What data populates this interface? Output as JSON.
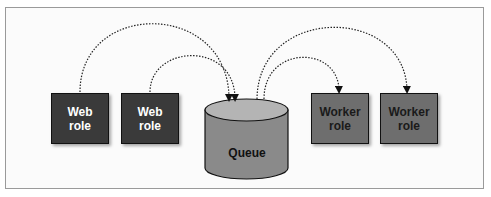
{
  "diagram": {
    "nodes": [
      {
        "id": "web1",
        "type": "web-role",
        "label_line1": "Web",
        "label_line2": "role"
      },
      {
        "id": "web2",
        "type": "web-role",
        "label_line1": "Web",
        "label_line2": "role"
      },
      {
        "id": "queue",
        "type": "queue",
        "label": "Queue"
      },
      {
        "id": "worker1",
        "type": "worker-role",
        "label_line1": "Worker",
        "label_line2": "role"
      },
      {
        "id": "worker2",
        "type": "worker-role",
        "label_line1": "Worker",
        "label_line2": "role"
      }
    ],
    "edges": [
      {
        "from": "web1",
        "to": "queue",
        "style": "dotted-arrow"
      },
      {
        "from": "web2",
        "to": "queue",
        "style": "dotted-arrow"
      },
      {
        "from": "queue",
        "to": "worker1",
        "style": "dotted-arrow"
      },
      {
        "from": "queue",
        "to": "worker2",
        "style": "dotted-arrow"
      }
    ],
    "colors": {
      "web_role_fill": "#3a3a3a",
      "worker_role_fill": "#6e6e6e",
      "queue_side": "#8a8a8a",
      "queue_top": "#b4b4b4"
    }
  }
}
